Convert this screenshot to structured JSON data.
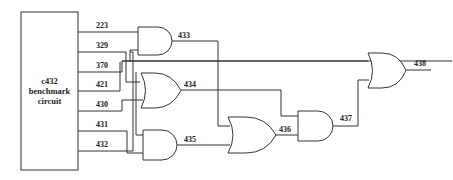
{
  "diagram": {
    "block": {
      "line1": "c432",
      "line2": "benchmark",
      "line3": "circuit"
    },
    "inputs": [
      {
        "label": "223"
      },
      {
        "label": "329"
      },
      {
        "label": "370"
      },
      {
        "label": "421"
      },
      {
        "label": "430"
      },
      {
        "label": "431"
      },
      {
        "label": "432"
      }
    ],
    "gates": [
      {
        "id": "g433",
        "type": "AND",
        "label": "433"
      },
      {
        "id": "g434",
        "type": "OR",
        "label": "434"
      },
      {
        "id": "g435",
        "type": "AND",
        "label": "435"
      },
      {
        "id": "g436",
        "type": "OR",
        "label": "436"
      },
      {
        "id": "g437",
        "type": "AND",
        "label": "437"
      },
      {
        "id": "g438",
        "type": "OR",
        "label": "438"
      }
    ]
  }
}
